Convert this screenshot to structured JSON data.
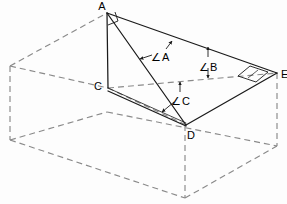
{
  "figure": {
    "type": "geometry-diagram",
    "canvas": {
      "width": 287,
      "height": 204,
      "background": "#fdfdfd"
    },
    "colors": {
      "solid_stroke": "#1a1a1a",
      "hidden_stroke": "#8a8a8a",
      "label_text": "#000000"
    },
    "vertices": [
      {
        "id": "A",
        "label": "A",
        "x": 107,
        "y": 13,
        "label_x": 102,
        "label_y": 9,
        "kind": "solid"
      },
      {
        "id": "C",
        "label": "C",
        "x": 108,
        "y": 88,
        "label_x": 97,
        "label_y": 86,
        "kind": "solid"
      },
      {
        "id": "D",
        "label": "D",
        "x": 186,
        "y": 125,
        "label_x": 190,
        "label_y": 136,
        "kind": "solid"
      },
      {
        "id": "E",
        "label": "E",
        "x": 277,
        "y": 73,
        "label_x": 280,
        "label_y": 77,
        "kind": "solid"
      }
    ],
    "box_corners": {
      "top_back_left": {
        "x": 10,
        "y": 66
      },
      "top_front_left": {
        "x": 108,
        "y": 88
      },
      "top_apex_left": {
        "x": 107,
        "y": 13
      },
      "top_back_right": {
        "x": 277,
        "y": 73
      },
      "top_front_mid": {
        "x": 186,
        "y": 125
      },
      "bottom_back_left": {
        "x": 10,
        "y": 140
      },
      "bottom_front": {
        "x": 185,
        "y": 198
      },
      "bottom_right": {
        "x": 277,
        "y": 146
      }
    },
    "solid_edges": [
      {
        "name": "edge-A-C",
        "from": "A",
        "to": "C"
      },
      {
        "name": "edge-A-D",
        "from": "A",
        "to": "D"
      },
      {
        "name": "edge-A-E",
        "from": "A",
        "to": "E"
      },
      {
        "name": "edge-C-D",
        "from": "C",
        "to": "D"
      },
      {
        "name": "edge-D-E",
        "from": "D",
        "to": "E"
      }
    ],
    "hidden_edges": [
      {
        "name": "hidden-edge-C-E"
      },
      {
        "name": "hidden-edge-top-back-left-to-A"
      },
      {
        "name": "hidden-edge-top-back-left-to-C"
      },
      {
        "name": "hidden-edge-top-back-left-to-E"
      },
      {
        "name": "hidden-edge-left-vertical"
      },
      {
        "name": "hidden-edge-right-vertical"
      },
      {
        "name": "hidden-edge-front-vertical"
      },
      {
        "name": "hidden-edge-bottom-left-front"
      },
      {
        "name": "hidden-edge-bottom-front-right"
      },
      {
        "name": "hidden-edge-bottom-left-back"
      },
      {
        "name": "hidden-edge-bottom-back-right"
      }
    ],
    "angle_annotations": [
      {
        "id": "angle-A",
        "symbol": "∠",
        "label": "A",
        "label_x": 160,
        "label_y": 57,
        "between": [
          "AE",
          "AD"
        ]
      },
      {
        "id": "angle-B",
        "symbol": "∠",
        "label": "B",
        "label_x": 208,
        "label_y": 67,
        "between": [
          "AE",
          "CE"
        ]
      },
      {
        "id": "angle-C",
        "symbol": "∠",
        "label": "C",
        "label_x": 180,
        "label_y": 101,
        "between": [
          "CE",
          "CD"
        ]
      }
    ],
    "right_angle_marks": [
      {
        "id": "right-angle-at-A",
        "x": 107,
        "y": 13,
        "note": "square marker at apex A"
      },
      {
        "id": "right-angle-at-E",
        "x": 258,
        "y": 71,
        "note": "parallelogram marker at E"
      }
    ]
  }
}
